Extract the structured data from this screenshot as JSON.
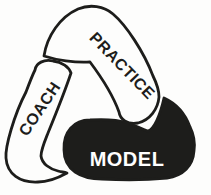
{
  "diagram": {
    "kind": "triangular-cycle",
    "background_color": "#fdfdfc",
    "outline_color": "#1d1d1b",
    "segments": [
      {
        "id": "practice",
        "label": "PRACTICE",
        "position": "top",
        "fill": "#fdfdfc",
        "label_color": "#1d1d1b",
        "label_angle_deg": 46
      },
      {
        "id": "coach",
        "label": "COACH",
        "position": "left",
        "fill": "#fdfdfc",
        "label_color": "#1d1d1b",
        "label_angle_deg": -56
      },
      {
        "id": "model",
        "label": "MODEL",
        "position": "bottom-right",
        "fill": "#1d1d1b",
        "label_color": "#ffffff",
        "label_angle_deg": 0
      }
    ]
  }
}
